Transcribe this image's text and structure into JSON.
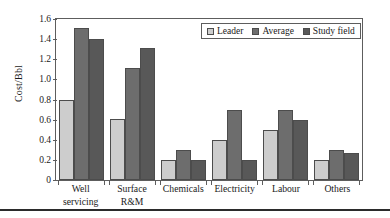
{
  "chart_data": {
    "type": "bar",
    "title": "",
    "xlabel": "",
    "ylabel": "Cost/Bbl",
    "ylim": [
      0,
      1.6
    ],
    "ytick_values": [
      0,
      0.2,
      0.4,
      0.6,
      0.8,
      1.0,
      1.2,
      1.4,
      1.6
    ],
    "ytick_labels": [
      "0",
      "0.2",
      "0.4",
      "0.6",
      "0.8",
      "1.0",
      "1.2",
      "1.4",
      "1.6"
    ],
    "grid": false,
    "legend_position": "top-right",
    "categories": [
      "Well servicing",
      "Surface R&M",
      "Chemicals",
      "Electricity",
      "Labour",
      "Others"
    ],
    "category_lines": [
      [
        "Well",
        "servicing"
      ],
      [
        "Surface",
        "R&M"
      ],
      [
        "Chemicals",
        ""
      ],
      [
        "Electricity",
        ""
      ],
      [
        "Labour",
        ""
      ],
      [
        "Others",
        ""
      ]
    ],
    "series": [
      {
        "name": "Leader",
        "color": "#cdcdcd",
        "values": [
          0.8,
          0.61,
          0.2,
          0.4,
          0.5,
          0.2
        ]
      },
      {
        "name": "Average",
        "color": "#6d6d6d",
        "values": [
          1.51,
          1.11,
          0.3,
          0.7,
          0.7,
          0.3
        ]
      },
      {
        "name": "Study field",
        "color": "#585858",
        "values": [
          1.4,
          1.31,
          0.2,
          0.2,
          0.6,
          0.27
        ]
      }
    ]
  }
}
